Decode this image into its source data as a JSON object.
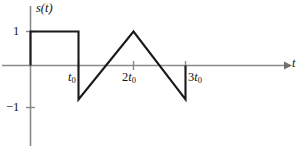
{
  "figure": {
    "background_color": "#ffffff",
    "axis_color": "#8a8a8a",
    "curve_color": "#1a1a1a"
  },
  "labels": {
    "y_axis": "s(t)",
    "y_axis_fn": "s",
    "y_axis_arg": "(t)",
    "x_axis": "t",
    "y_tick_pos_one": "1",
    "y_tick_neg_one": "−1",
    "x_tick_t0_base": "t",
    "x_tick_t0_sub": "0",
    "x_tick_2t0_coef": "2",
    "x_tick_2t0_base": "t",
    "x_tick_2t0_sub": "0",
    "x_tick_3t0_coef": "3",
    "x_tick_3t0_base": "t",
    "x_tick_3t0_sub": "0"
  },
  "chart_data": {
    "type": "line",
    "title": "",
    "xlabel": "t",
    "ylabel": "s(t)",
    "xlim": [
      -0.35,
      5.1
    ],
    "ylim": [
      -1.55,
      1.45
    ],
    "grid": false,
    "legend": null,
    "x_tick_values": [
      1,
      2,
      3
    ],
    "x_tick_labels": [
      "t₀",
      "2t₀",
      "3t₀"
    ],
    "y_tick_values": [
      1,
      -1
    ],
    "y_tick_labels": [
      "1",
      "−1"
    ],
    "series": [
      {
        "name": "s(t)",
        "comment": "piecewise: unit rectangular pulse on [0, t0], vertical drop to -1 at t0, linear ramp up to +1 at 2t0, linear ramp down to -1 at 3t0, vertical return to 0",
        "x": [
          0,
          0,
          1,
          1,
          2,
          3,
          3
        ],
        "y": [
          0,
          1,
          1,
          -1,
          1,
          -1,
          0
        ]
      }
    ],
    "annotations": []
  }
}
